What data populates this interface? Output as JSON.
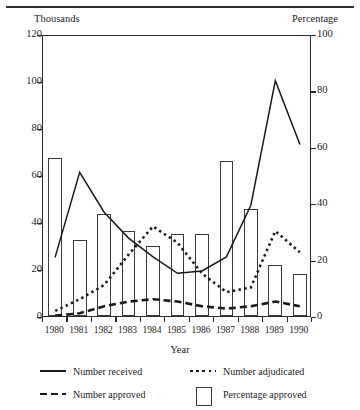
{
  "figure": {
    "left_unit_label": "Thousands",
    "right_unit_label": "Percentage",
    "axis_title": "Year"
  },
  "legend": {
    "position": "bottom",
    "items": [
      {
        "key": "solid-line",
        "label": "Number received"
      },
      {
        "key": "dotted-line",
        "label": "Number adjudicated"
      },
      {
        "key": "dashed-line",
        "label": "Number approved"
      },
      {
        "key": "open-bar",
        "label": "Percentage approved"
      }
    ]
  },
  "chart_data": {
    "type": "bar",
    "title": "",
    "xlabel": "Year",
    "ylabel": "Thousands",
    "y2label": "Percentage",
    "ylim": [
      0,
      120
    ],
    "y2lim": [
      0,
      100
    ],
    "yticks": [
      0,
      20,
      40,
      60,
      80,
      100,
      120
    ],
    "y2ticks": [
      0,
      20,
      40,
      60,
      80,
      100
    ],
    "grid": false,
    "legend_position": "bottom",
    "categories": [
      "1980",
      "1981",
      "1982",
      "1983",
      "1984",
      "1985",
      "1986",
      "1987",
      "1988",
      "1989",
      "1990"
    ],
    "series": [
      {
        "name": "Percentage approved",
        "type": "bar",
        "axis": "right",
        "unit": "percent",
        "values": [
          56,
          27,
          36,
          30,
          25,
          29,
          29,
          55,
          38,
          18,
          15
        ]
      },
      {
        "name": "Number received",
        "type": "line",
        "style": "solid",
        "axis": "left",
        "unit": "thousands",
        "values": [
          26,
          62,
          45,
          34,
          26,
          19,
          20,
          26,
          48,
          101,
          74
        ]
      },
      {
        "name": "Number adjudicated",
        "type": "line",
        "style": "dotted",
        "axis": "left",
        "unit": "thousands",
        "values": [
          3,
          8,
          14,
          27,
          39,
          32,
          19,
          11,
          13,
          37,
          28
        ]
      },
      {
        "name": "Number approved",
        "type": "line",
        "style": "dashed",
        "axis": "left",
        "unit": "thousands",
        "values": [
          1,
          2,
          5,
          7,
          8,
          7,
          5,
          4,
          5,
          7,
          5
        ]
      }
    ]
  }
}
